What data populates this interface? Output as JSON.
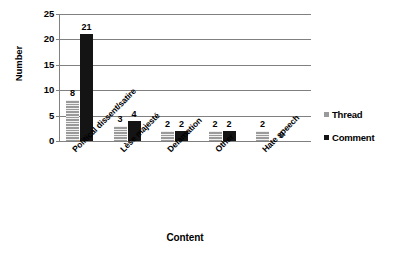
{
  "chart_data": {
    "type": "bar",
    "title": "",
    "xlabel": "Content",
    "ylabel": "Number",
    "categories": [
      "Political dissent/satire",
      "Lèse majesté",
      "Defamation",
      "Other",
      "Hate speech"
    ],
    "series": [
      {
        "name": "Thread",
        "color": "#9a9a9a",
        "values": [
          8,
          3,
          2,
          2,
          2
        ]
      },
      {
        "name": "Comment",
        "color": "#141414",
        "values": [
          21,
          4,
          2,
          2,
          0
        ]
      }
    ],
    "ylim": [
      0,
      25
    ],
    "yticks": [
      0,
      5,
      10,
      15,
      20,
      25
    ],
    "ytick_labels": [
      "0",
      "5",
      "10",
      "15",
      "20",
      "25"
    ],
    "grid": "horizontal",
    "legend_position": "right",
    "data_labels": {
      "Thread": [
        "8",
        "3",
        "2",
        "2",
        "2"
      ],
      "Comment": [
        "21",
        "4",
        "2",
        "2",
        "0"
      ]
    }
  },
  "legend": {
    "entries": [
      {
        "label": "Thread",
        "swatch": "#9a9a9a"
      },
      {
        "label": "Comment",
        "swatch": "#141414"
      }
    ]
  }
}
